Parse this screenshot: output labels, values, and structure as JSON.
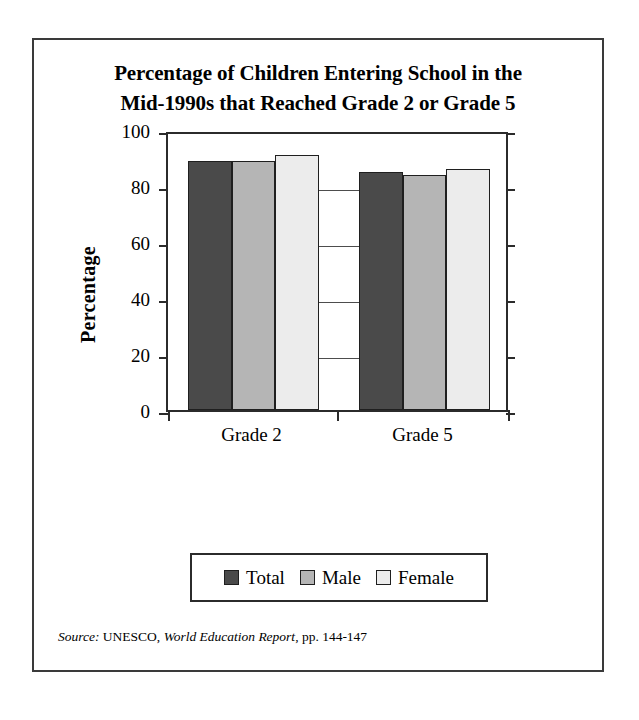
{
  "chart_data": {
    "type": "bar",
    "title": "Percentage of Children Entering School in the Mid-1990s that Reached Grade 2 or Grade 5",
    "title_line1": "Percentage of Children Entering School in the",
    "title_line2": "Mid-1990s that Reached Grade 2 or Grade 5",
    "categories": [
      "Grade 2",
      "Grade 5"
    ],
    "series": [
      {
        "name": "Total",
        "values": [
          89,
          85
        ],
        "color": "#4a4a4a"
      },
      {
        "name": "Male",
        "values": [
          89,
          84
        ],
        "color": "#b5b5b5"
      },
      {
        "name": "Female",
        "values": [
          91,
          86
        ],
        "color": "#ececec"
      }
    ],
    "xlabel": "",
    "ylabel": "Percentage",
    "ylim": [
      0,
      100
    ],
    "yticks": [
      0,
      20,
      40,
      60,
      80,
      100
    ],
    "ytick_labels": [
      "0",
      "20",
      "40",
      "60",
      "80",
      "100"
    ],
    "grid": false,
    "legend_position": "bottom"
  },
  "source_note": {
    "label": "Source:",
    "publisher": "UNESCO,",
    "publication": "World Education Report",
    "pages": ", pp. 144-147"
  }
}
